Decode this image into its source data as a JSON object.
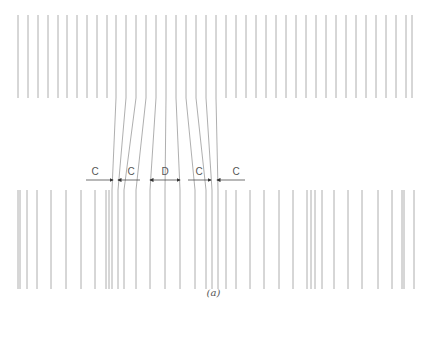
{
  "figure": {
    "caption": "(a)",
    "line_color": "#9a9a9a",
    "arrow_color": "#333333",
    "top_band": {
      "y1": 15,
      "y2": 98
    },
    "bottom_band": {
      "y1": 190,
      "y2": 289
    },
    "top_left_x": [
      18,
      28,
      38,
      48,
      58,
      67,
      77,
      87,
      97,
      107
    ],
    "top_right_x": [
      226,
      236,
      246,
      256,
      266,
      276,
      286,
      296,
      306,
      316,
      326,
      336,
      346,
      356,
      366,
      376,
      386,
      396,
      406,
      412
    ],
    "transition_lines": [
      {
        "x_top": 116,
        "y_top": 15,
        "x_bot": 112,
        "y_bot": 289
      },
      {
        "x_top": 126,
        "y_top": 15,
        "x_bot": 118,
        "y_bot": 289
      },
      {
        "x_top": 136,
        "y_top": 15,
        "x_bot": 124,
        "y_bot": 289
      },
      {
        "x_top": 146,
        "y_top": 15,
        "x_bot": 136,
        "y_bot": 289
      },
      {
        "x_top": 156,
        "y_top": 15,
        "x_bot": 150,
        "y_bot": 289
      },
      {
        "x_top": 166,
        "y_top": 15,
        "x_bot": 165,
        "y_bot": 289
      },
      {
        "x_top": 176,
        "y_top": 15,
        "x_bot": 180,
        "y_bot": 289
      },
      {
        "x_top": 186,
        "y_top": 15,
        "x_bot": 195,
        "y_bot": 289
      },
      {
        "x_top": 196,
        "y_top": 15,
        "x_bot": 206,
        "y_bot": 289
      },
      {
        "x_top": 206,
        "y_top": 15,
        "x_bot": 212,
        "y_bot": 289
      },
      {
        "x_top": 216,
        "y_top": 15,
        "x_bot": 218,
        "y_bot": 289
      }
    ],
    "bottom_left_x": [
      18,
      20,
      27,
      37,
      51,
      66,
      81,
      95,
      106,
      109
    ],
    "bottom_right_x": [
      226,
      236,
      250,
      264,
      279,
      293,
      307,
      311,
      315,
      322,
      334,
      348,
      362,
      378,
      392,
      402,
      404,
      414
    ],
    "dimensions": [
      {
        "label": "C",
        "y": 180,
        "x1": 86,
        "x2": 113,
        "label_x": 95,
        "arrow_end": "right"
      },
      {
        "label": "C",
        "y": 180,
        "x1": 118,
        "x2": 140,
        "label_x": 131,
        "arrow_end": "left"
      },
      {
        "label": "D",
        "y": 180,
        "x1": 150,
        "x2": 180,
        "label_x": 165,
        "arrow_end": "both"
      },
      {
        "label": "C",
        "y": 180,
        "x1": 188,
        "x2": 211,
        "label_x": 199,
        "arrow_end": "right"
      },
      {
        "label": "C",
        "y": 180,
        "x1": 217,
        "x2": 245,
        "label_x": 236,
        "arrow_end": "left"
      }
    ]
  }
}
